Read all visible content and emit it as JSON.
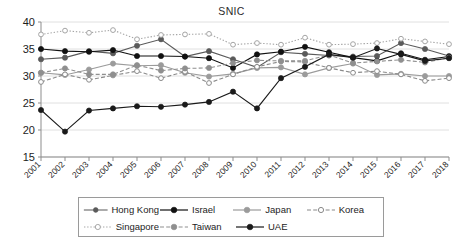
{
  "chart": {
    "title": "SNIC",
    "type_label": "line"
  },
  "chart_data": {
    "type": "line",
    "title": "SNIC",
    "xlabel": "",
    "ylabel": "",
    "ylim": [
      15,
      40
    ],
    "yticks": [
      15,
      20,
      25,
      30,
      35,
      40
    ],
    "grid": true,
    "legend_position": "bottom",
    "x": [
      2001,
      2002,
      2003,
      2004,
      2005,
      2006,
      2007,
      2008,
      2009,
      2010,
      2011,
      2012,
      2013,
      2014,
      2015,
      2016,
      2017,
      2018
    ],
    "categories": [
      "2001",
      "2002",
      "2003",
      "2004",
      "2005",
      "2006",
      "2007",
      "2008",
      "2009",
      "2010",
      "2011",
      "2012",
      "2013",
      "2014",
      "2015",
      "2016",
      "2017",
      "2018"
    ],
    "series": [
      {
        "name": "Hong Kong",
        "color": "#5a5a5a",
        "line_style": "solid",
        "marker": "circle-filled",
        "values": [
          33.1,
          33.4,
          34.6,
          34.2,
          35.6,
          36.8,
          33.6,
          34.6,
          33.1,
          31.6,
          34.4,
          34.1,
          33.8,
          33.6,
          33.7,
          36.1,
          35.0,
          33.7
        ]
      },
      {
        "name": "Israel",
        "color": "#111111",
        "line_style": "solid",
        "marker": "circle-filled",
        "values": [
          35.0,
          34.6,
          34.5,
          34.8,
          33.7,
          33.7,
          33.6,
          33.3,
          31.5,
          34.0,
          34.5,
          35.4,
          34.4,
          33.4,
          32.8,
          34.2,
          33.0,
          33.6
        ]
      },
      {
        "name": "Japan",
        "color": "#9b9b9b",
        "line_style": "solid",
        "marker": "circle-filled",
        "values": [
          30.6,
          30.2,
          31.2,
          32.3,
          31.9,
          32.0,
          30.6,
          29.9,
          30.4,
          31.5,
          31.6,
          30.3,
          31.5,
          32.3,
          30.2,
          30.4,
          30.0,
          30.0
        ]
      },
      {
        "name": "Korea",
        "color": "#8a8a8a",
        "line_style": "dashed",
        "marker": "circle-open",
        "values": [
          28.9,
          30.3,
          29.3,
          30.1,
          30.9,
          29.6,
          30.8,
          28.7,
          30.3,
          31.7,
          32.7,
          32.6,
          31.5,
          30.6,
          30.9,
          30.3,
          29.1,
          29.6
        ]
      },
      {
        "name": "Singapore",
        "color": "#a5a5a5",
        "line_style": "dotted",
        "marker": "circle-open",
        "values": [
          37.7,
          38.4,
          38.0,
          38.5,
          36.8,
          37.6,
          37.7,
          37.8,
          35.8,
          36.1,
          35.8,
          37.1,
          35.8,
          35.9,
          36.1,
          36.9,
          36.4,
          35.9
        ]
      },
      {
        "name": "Taiwan",
        "color": "#8f8f8f",
        "line_style": "dashed",
        "marker": "circle-filled",
        "values": [
          30.6,
          31.4,
          30.3,
          30.3,
          32.0,
          31.0,
          31.4,
          31.5,
          32.4,
          32.9,
          32.8,
          32.8,
          33.9,
          32.4,
          32.7,
          33.0,
          32.5,
          33.4
        ]
      },
      {
        "name": "UAE",
        "color": "#1a1a1a",
        "line_style": "solid",
        "marker": "circle-filled",
        "values": [
          23.7,
          19.7,
          23.6,
          24.0,
          24.4,
          24.3,
          24.7,
          25.2,
          27.1,
          24.0,
          29.6,
          31.7,
          34.0,
          33.4,
          35.1,
          34.0,
          32.8,
          33.3
        ]
      }
    ]
  },
  "legend": {
    "rows": [
      [
        {
          "label": "Hong Kong",
          "key": "hong-kong"
        },
        {
          "label": "Israel",
          "key": "israel"
        },
        {
          "label": "Japan",
          "key": "japan"
        },
        {
          "label": "Korea",
          "key": "korea"
        }
      ],
      [
        {
          "label": "Singapore",
          "key": "singapore"
        },
        {
          "label": "Taiwan",
          "key": "taiwan"
        },
        {
          "label": "UAE",
          "key": "uae"
        }
      ]
    ]
  }
}
